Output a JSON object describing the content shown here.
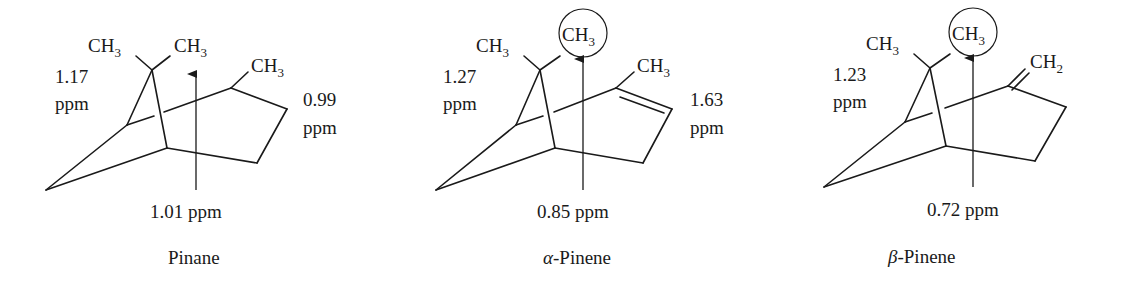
{
  "figure": {
    "molecules": [
      {
        "id": "pinane",
        "name": "Pinane",
        "greek_prefix": "",
        "gem_methyl_left": "CH",
        "gem_methyl_right": "CH",
        "ring_substituent": "CH",
        "ring_substituent_subscript": "3",
        "methyl_subscript": "3",
        "left_shift_value": "1.17",
        "left_shift_unit": "ppm",
        "right_shift_value": "0.99",
        "right_shift_unit": "ppm",
        "arrow_shift": "1.01 ppm",
        "circled_methyl": false
      },
      {
        "id": "alpha-pinene",
        "name": "-Pinene",
        "greek_prefix": "α",
        "gem_methyl_left": "CH",
        "gem_methyl_right": "CH",
        "ring_substituent": "CH",
        "ring_substituent_subscript": "3",
        "methyl_subscript": "3",
        "left_shift_value": "1.27",
        "left_shift_unit": "ppm",
        "right_shift_value": "1.63",
        "right_shift_unit": "ppm",
        "arrow_shift": "0.85 ppm",
        "circled_methyl": true
      },
      {
        "id": "beta-pinene",
        "name": "-Pinene",
        "greek_prefix": "β",
        "gem_methyl_left": "CH",
        "gem_methyl_right": "CH",
        "ring_substituent": "CH",
        "ring_substituent_subscript": "2",
        "methyl_subscript": "3",
        "left_shift_value": "1.23",
        "left_shift_unit": "ppm",
        "arrow_shift": "0.72 ppm",
        "circled_methyl": true
      }
    ]
  }
}
